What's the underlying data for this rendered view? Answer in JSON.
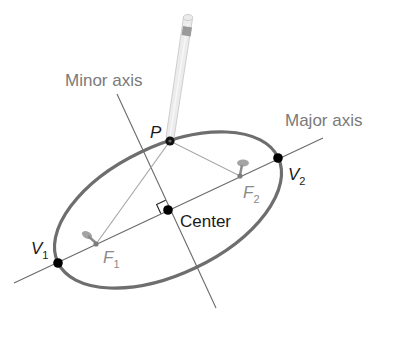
{
  "diagram": {
    "labels": {
      "minor_axis": "Minor axis",
      "major_axis": "Major axis",
      "point": "P",
      "center": "Center",
      "vertex1_main": "V",
      "vertex1_sub": "1",
      "vertex2_main": "V",
      "vertex2_sub": "2",
      "focus1_main": "F",
      "focus1_sub": "1",
      "focus2_main": "F",
      "focus2_sub": "2"
    },
    "points": {
      "center": [
        168,
        210
      ],
      "P": [
        170,
        141
      ],
      "V1": [
        58,
        263
      ],
      "V2": [
        278,
        158
      ],
      "F1": [
        96,
        244
      ],
      "F2": [
        240,
        176
      ]
    },
    "ellipse": {
      "cx": 168,
      "cy": 210,
      "rx": 122,
      "ry": 64,
      "rotation_deg": -25.5
    },
    "colors": {
      "ellipse_stroke": "#6e6e6e",
      "axis_line": "#6a6a6a",
      "string_line": "#a8a8a8",
      "point_fill": "#000000",
      "label_gray": "#7a7a7a",
      "label_dark": "#1a1a1a",
      "pencil_body": "#e8e8e8",
      "pencil_band": "#9a9a9a",
      "pin": "#9c9c9c"
    }
  }
}
